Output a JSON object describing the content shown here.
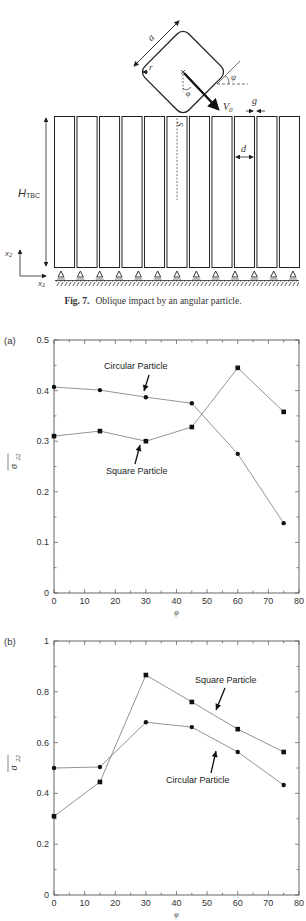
{
  "figure7": {
    "caption_label": "Fig. 7.",
    "caption_text": "Oblique impact by an angular particle.",
    "labels": {
      "a": "a",
      "r": "r",
      "psi": "ψ",
      "phi": "φ",
      "v0": "V",
      "v0_sub": "0",
      "g": "g",
      "s": "S",
      "d": "d",
      "h": "H",
      "h_sub": "TBC",
      "x2": "x",
      "x2_sub": "2",
      "x1": "x",
      "x1_sub": "1"
    },
    "column_count": 11
  },
  "chart_data": [
    {
      "panel": "(a)",
      "type": "line",
      "title": "",
      "xlabel": "φ",
      "ylabel": "σ̄22",
      "x": [
        0,
        15,
        30,
        45,
        60,
        75
      ],
      "xlim": [
        0,
        80
      ],
      "ylim": [
        0,
        0.5
      ],
      "xticks": [
        "0",
        "10",
        "20",
        "30",
        "40",
        "50",
        "60",
        "70",
        "80"
      ],
      "yticks": [
        "0",
        "0.1",
        "0.2",
        "0.3",
        "0.4",
        "0.5"
      ],
      "grid": false,
      "series": [
        {
          "name": "Circular Particle",
          "marker": "circle",
          "values": [
            0.407,
            0.401,
            0.387,
            0.375,
            0.275,
            0.138
          ]
        },
        {
          "name": "Square Particle",
          "marker": "square",
          "values": [
            0.31,
            0.32,
            0.3,
            0.328,
            0.445,
            0.358
          ]
        }
      ],
      "annotations": [
        {
          "text": "Circular Particle",
          "points_to": "circle series near φ=30"
        },
        {
          "text": "Square Particle",
          "points_to": "square series near φ=30"
        }
      ]
    },
    {
      "panel": "(b)",
      "type": "line",
      "title": "",
      "xlabel": "φ",
      "ylabel": "σ̄22",
      "x": [
        0,
        15,
        30,
        45,
        60,
        75
      ],
      "xlim": [
        0,
        80
      ],
      "ylim": [
        0,
        1
      ],
      "xticks": [
        "0",
        "10",
        "20",
        "30",
        "40",
        "50",
        "60",
        "70",
        "80"
      ],
      "yticks": [
        "0",
        "0.2",
        "0.4",
        "0.6",
        "0.8",
        "1"
      ],
      "grid": false,
      "series": [
        {
          "name": "Square Particle",
          "marker": "square",
          "values": [
            0.31,
            0.445,
            0.866,
            0.76,
            0.653,
            0.563
          ]
        },
        {
          "name": "Circular Particle",
          "marker": "circle",
          "values": [
            0.5,
            0.504,
            0.68,
            0.661,
            0.563,
            0.433
          ]
        }
      ],
      "annotations": [
        {
          "text": "Square Particle",
          "points_to": "square series near φ=52"
        },
        {
          "text": "Circular Particle",
          "points_to": "circle series near φ=52"
        }
      ]
    }
  ]
}
